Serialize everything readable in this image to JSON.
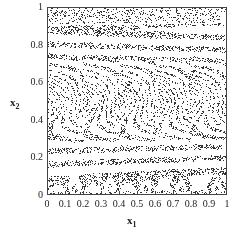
{
  "chart_data": {
    "type": "scatter",
    "title": "",
    "xlabel": "x",
    "xlabel_sub": "1",
    "ylabel": "x",
    "ylabel_sub": "2",
    "xlim": [
      0,
      1
    ],
    "ylim": [
      0,
      1
    ],
    "xticks": [
      "0",
      "0.1",
      "0.2",
      "0.3",
      "0.4",
      "0.5",
      "0.6",
      "0.7",
      "0.8",
      "0.9",
      "1"
    ],
    "yticks": [
      "0",
      "0.2",
      "0.4",
      "0.6",
      "0.8",
      "1"
    ],
    "grid": false,
    "legend": null,
    "marker_color": "#333333",
    "band_pattern": {
      "chevron_center_y": 0.5,
      "chevron_period_x": 0.2,
      "horizontal_band_count": 14,
      "point_count": 14000
    }
  }
}
